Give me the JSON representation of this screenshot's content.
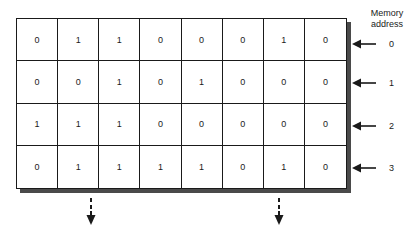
{
  "memory": {
    "header": "Memory address",
    "header_line1": "Memory",
    "header_line2": "address",
    "rows": [
      {
        "address": "0",
        "bits": [
          "0",
          "1",
          "1",
          "0",
          "0",
          "0",
          "1",
          "0"
        ]
      },
      {
        "address": "1",
        "bits": [
          "0",
          "0",
          "1",
          "0",
          "1",
          "0",
          "0",
          "0"
        ]
      },
      {
        "address": "2",
        "bits": [
          "1",
          "1",
          "1",
          "0",
          "0",
          "0",
          "0",
          "0"
        ]
      },
      {
        "address": "3",
        "bits": [
          "0",
          "1",
          "1",
          "1",
          "1",
          "0",
          "1",
          "0"
        ]
      }
    ]
  },
  "icons": {
    "address_pointer": "left-arrow-icon",
    "output_indicator": "dashed-down-arrow-icon"
  },
  "colors": {
    "line": "#1a1a1a",
    "shadow": "#4a4a4a",
    "background": "#ffffff"
  }
}
